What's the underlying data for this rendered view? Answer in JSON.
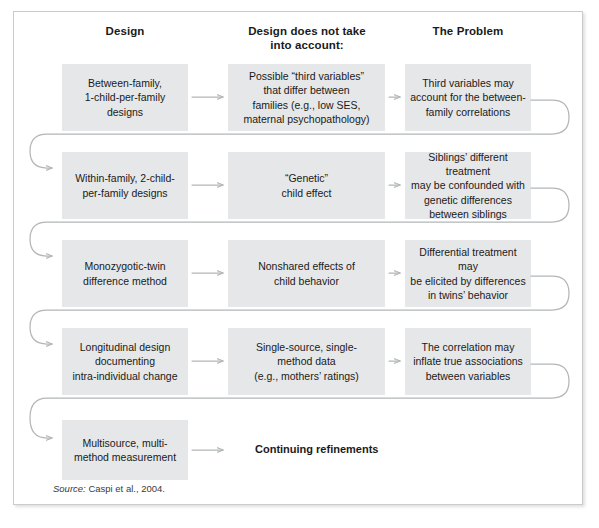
{
  "figure": {
    "source_prefix": "Source:",
    "source_text": "Caspi et al., 2004.",
    "box_color": "#e6e7e8",
    "arrow_color": "#b3b6b8",
    "border_color": "#c9ccce",
    "text_color": "#1a1a1a"
  },
  "columns": [
    {
      "id": "design",
      "label": "Design"
    },
    {
      "id": "not-accounted",
      "label": "Design does not take\ninto account:"
    },
    {
      "id": "problem",
      "label": "The Problem"
    }
  ],
  "rows": [
    {
      "id": "row-1",
      "design": "Between-family,\n1-child-per-family\ndesigns",
      "not_accounted": "Possible “third variables”\nthat differ between\nfamilies (e.g., low SES,\nmaternal psychopathology)",
      "problem": "Third variables may\naccount for the between-\nfamily correlations"
    },
    {
      "id": "row-2",
      "design": "Within-family, 2-child-\nper-family designs",
      "not_accounted": "“Genetic”\nchild effect",
      "problem": "Siblings’ different treatment\nmay be confounded with\ngenetic differences\nbetween siblings"
    },
    {
      "id": "row-3",
      "design": "Monozygotic-twin\ndifference method",
      "not_accounted": "Nonshared effects of\nchild behavior",
      "problem": "Differential treatment may\nbe elicited by differences\nin twins’ behavior"
    },
    {
      "id": "row-4",
      "design": "Longitudinal design\ndocumenting\nintra-individual change",
      "not_accounted": "Single-source, single-\nmethod data\n(e.g., mothers’ ratings)",
      "problem": "The correlation may\ninflate true associations\nbetween variables"
    },
    {
      "id": "row-5",
      "design": "Multisource, multi-\nmethod measurement",
      "not_accounted": "Continuing refinements",
      "problem": ""
    }
  ],
  "icons": {
    "arrow_right": "arrow-right-icon",
    "loop_connector": "loop-connector-icon"
  }
}
